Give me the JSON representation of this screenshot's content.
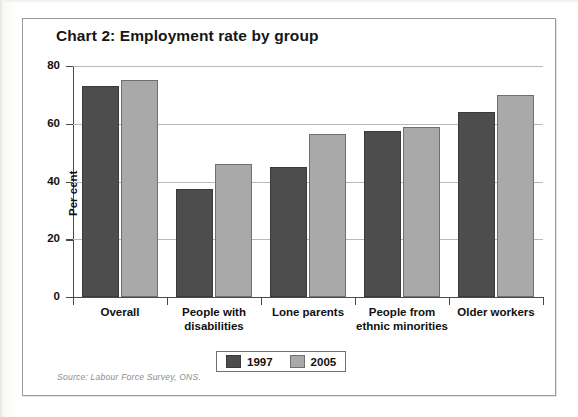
{
  "chart_frame": {
    "border_color": "#9a9a96"
  },
  "source": {
    "text": "Source: Labour Force Survey, ONS."
  },
  "legend": {
    "position": "bottom-center",
    "entries": [
      {
        "label": "1997",
        "color": "#4d4d4d"
      },
      {
        "label": "2005",
        "color": "#a9a9a9"
      }
    ]
  },
  "chart_data": {
    "type": "bar",
    "title": "Chart 2: Employment rate by group",
    "xlabel": "",
    "ylabel": "Per cent",
    "ylim": [
      0,
      80
    ],
    "yticks": [
      0,
      20,
      40,
      60,
      80
    ],
    "ytick_labels": [
      "0",
      "20",
      "40",
      "60",
      "80"
    ],
    "grid": true,
    "grid_axis": "y",
    "categories": [
      "Overall",
      "People with disabilities",
      "Lone parents",
      "People from ethnic minorities",
      "Older workers"
    ],
    "category_lines": [
      [
        "Overall"
      ],
      [
        "People with",
        "disabilities"
      ],
      [
        "Lone parents"
      ],
      [
        "People from",
        "ethnic minorities"
      ],
      [
        "Older workers"
      ]
    ],
    "series": [
      {
        "name": "1997",
        "color": "#4d4d4d",
        "values": [
          73,
          37.5,
          45,
          57.5,
          64
        ]
      },
      {
        "name": "2005",
        "color": "#a9a9a9",
        "values": [
          75,
          46,
          56.5,
          59,
          70
        ]
      }
    ]
  }
}
